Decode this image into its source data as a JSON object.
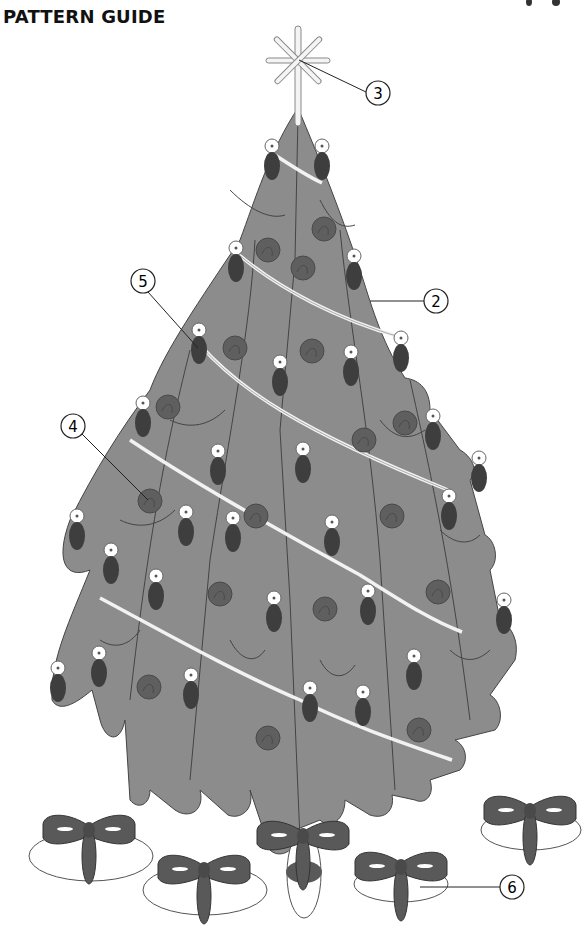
{
  "title": "PATTERN GUIDE",
  "colors": {
    "tree": "#8c8c8c",
    "ornament_dark": "#3e3e3e",
    "ornament_round": "#5f5f5f",
    "bow": "#595959",
    "outline": "#333333",
    "garland": "#f2f2f2"
  },
  "callouts": [
    {
      "number": "2",
      "target": "tree-body"
    },
    {
      "number": "3",
      "target": "star-topper"
    },
    {
      "number": "4",
      "target": "round-ornament"
    },
    {
      "number": "5",
      "target": "oval-ornament"
    },
    {
      "number": "6",
      "target": "gift-bow"
    }
  ]
}
